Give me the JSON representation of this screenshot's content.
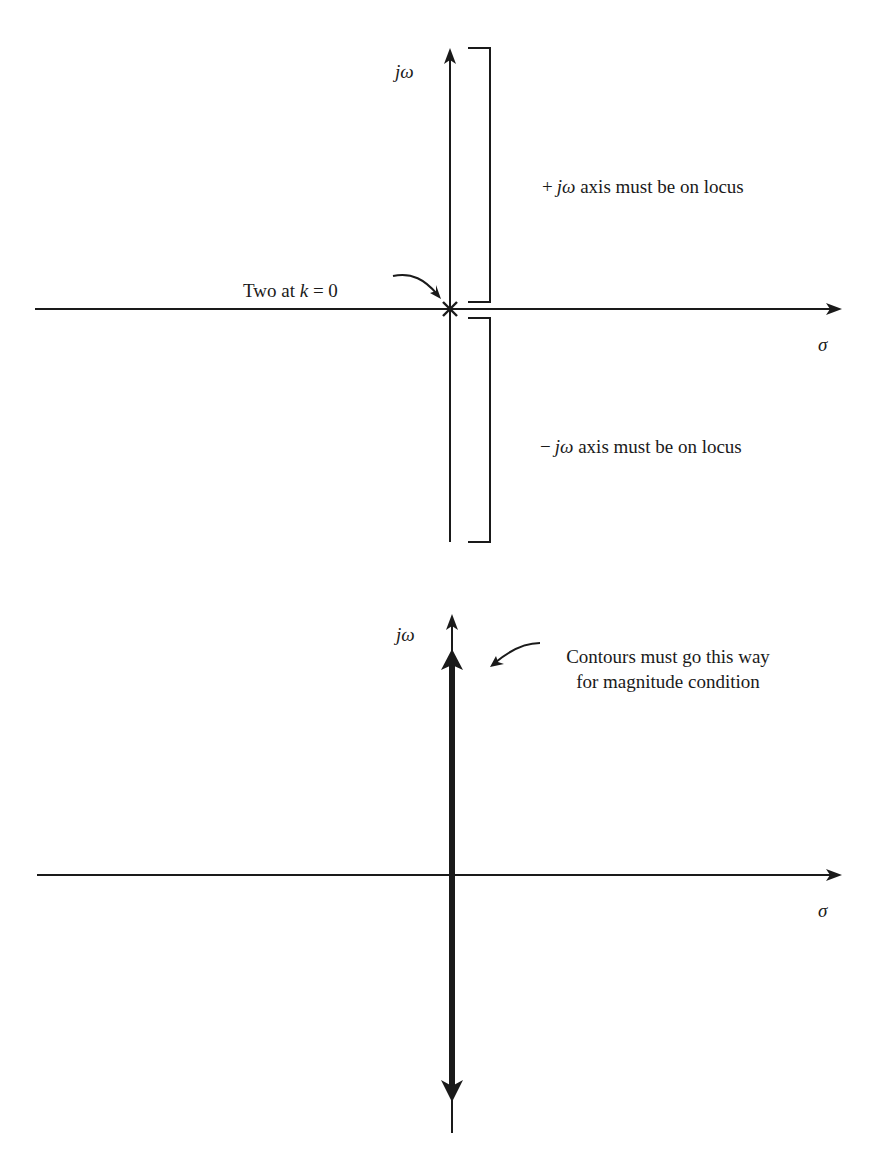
{
  "top_diagram": {
    "vertical_axis_label": "jω",
    "horizontal_axis_label": "σ",
    "pole_marker": "×",
    "pole_annotation": {
      "prefix": "Two at ",
      "var": "k",
      "suffix": " = 0"
    },
    "upper_bracket_label": {
      "sign": "+",
      "var": "jω",
      "text": " axis must be on locus"
    },
    "lower_bracket_label": {
      "sign": "−",
      "var": "jω",
      "text": " axis must be on locus"
    }
  },
  "bottom_diagram": {
    "vertical_axis_label": "jω",
    "horizontal_axis_label": "σ",
    "annotation_line1": "Contours must go this way",
    "annotation_line2": "for magnitude condition"
  },
  "colors": {
    "ink": "#1a1a1a",
    "background": "#ffffff"
  }
}
